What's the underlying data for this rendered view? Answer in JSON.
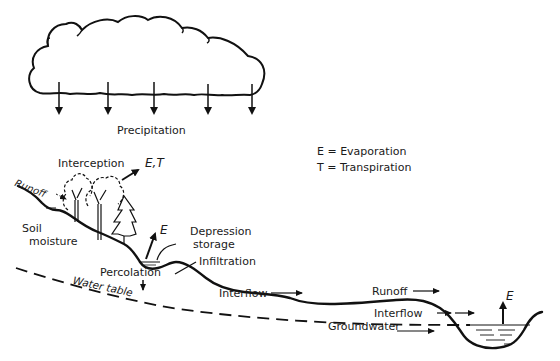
{
  "diagram": {
    "legend": {
      "e_def": "E = Evaporation",
      "t_def": "T = Transpiration"
    },
    "labels": {
      "precipitation": "Precipitation",
      "interception": "Interception",
      "et": "E,T",
      "runoff_top": "Runoff",
      "soil_moisture_1": "Soil",
      "soil_moisture_2": "moisture",
      "e_depression": "E",
      "depression_1": "Depression",
      "depression_2": "storage",
      "infiltration": "Infiltration",
      "percolation": "Percolation",
      "water_table": "Water table",
      "interflow_mid": "Interflow",
      "runoff_right": "Runoff",
      "interflow_right": "Interflow",
      "groundwater": "Groundwater",
      "e_stream": "E"
    },
    "colors": {
      "ink": "#111111",
      "background": "#ffffff"
    }
  }
}
